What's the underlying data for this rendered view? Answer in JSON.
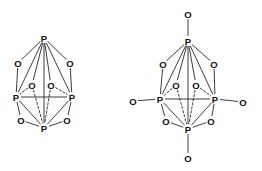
{
  "figure": {
    "background_color": "#ffffff",
    "bond_color": "#1a1a1a",
    "label_color": "#111111"
  },
  "structures": [
    {
      "id": "p4o6",
      "name": "P4O6",
      "atoms": [
        {
          "id": "p-top",
          "element": "P",
          "x": 44,
          "y": 38
        },
        {
          "id": "p-left",
          "element": "P",
          "x": 16,
          "y": 97
        },
        {
          "id": "p-right",
          "element": "P",
          "x": 72,
          "y": 97
        },
        {
          "id": "p-bottom",
          "element": "P",
          "x": 44,
          "y": 128
        },
        {
          "id": "o-upper-left",
          "element": "O",
          "x": 18,
          "y": 63
        },
        {
          "id": "o-upper-right",
          "element": "O",
          "x": 70,
          "y": 63
        },
        {
          "id": "o-mid-left",
          "element": "O",
          "x": 32,
          "y": 85
        },
        {
          "id": "o-mid-right",
          "element": "O",
          "x": 51,
          "y": 85
        },
        {
          "id": "o-lower-left",
          "element": "O",
          "x": 21,
          "y": 120
        },
        {
          "id": "o-lower-right",
          "element": "O",
          "x": 67,
          "y": 120
        }
      ],
      "bonds": [
        {
          "from": "p-top",
          "to": "o-upper-left",
          "style": "solid"
        },
        {
          "from": "p-top",
          "to": "o-upper-right",
          "style": "solid"
        },
        {
          "from": "p-top",
          "to": "o-mid-left",
          "style": "solid"
        },
        {
          "from": "p-top",
          "to": "o-mid-right",
          "style": "solid"
        },
        {
          "from": "p-top",
          "to": "p-left",
          "style": "solid"
        },
        {
          "from": "p-top",
          "to": "p-right",
          "style": "solid"
        },
        {
          "from": "p-top",
          "to": "p-bottom",
          "style": "solid"
        },
        {
          "from": "o-upper-left",
          "to": "p-left",
          "style": "solid"
        },
        {
          "from": "o-upper-right",
          "to": "p-right",
          "style": "solid"
        },
        {
          "from": "o-mid-left",
          "to": "p-left",
          "style": "dashed"
        },
        {
          "from": "o-mid-right",
          "to": "p-right",
          "style": "dashed"
        },
        {
          "from": "o-mid-left",
          "to": "p-bottom",
          "style": "dashed"
        },
        {
          "from": "o-mid-right",
          "to": "p-bottom",
          "style": "dashed"
        },
        {
          "from": "p-left",
          "to": "p-right",
          "style": "solid"
        },
        {
          "from": "p-left",
          "to": "p-bottom",
          "style": "solid"
        },
        {
          "from": "p-right",
          "to": "p-bottom",
          "style": "solid"
        },
        {
          "from": "p-left",
          "to": "o-lower-left",
          "style": "solid"
        },
        {
          "from": "p-right",
          "to": "o-lower-right",
          "style": "solid"
        },
        {
          "from": "o-lower-left",
          "to": "p-bottom",
          "style": "solid"
        },
        {
          "from": "o-lower-right",
          "to": "p-bottom",
          "style": "solid"
        }
      ]
    },
    {
      "id": "p4o10",
      "name": "P4O10",
      "atoms": [
        {
          "id": "p-top",
          "element": "P",
          "x": 188,
          "y": 41
        },
        {
          "id": "p-left",
          "element": "P",
          "x": 160,
          "y": 99
        },
        {
          "id": "p-right",
          "element": "P",
          "x": 215,
          "y": 99
        },
        {
          "id": "p-bottom",
          "element": "P",
          "x": 188,
          "y": 129
        },
        {
          "id": "o-upper-left",
          "element": "O",
          "x": 163,
          "y": 64
        },
        {
          "id": "o-upper-right",
          "element": "O",
          "x": 214,
          "y": 64
        },
        {
          "id": "o-mid-left",
          "element": "O",
          "x": 176,
          "y": 85
        },
        {
          "id": "o-mid-right",
          "element": "O",
          "x": 196,
          "y": 85
        },
        {
          "id": "o-lower-left",
          "element": "O",
          "x": 166,
          "y": 121
        },
        {
          "id": "o-lower-right",
          "element": "O",
          "x": 211,
          "y": 121
        },
        {
          "id": "o-term-top",
          "element": "O",
          "x": 188,
          "y": 14
        },
        {
          "id": "o-term-left",
          "element": "O",
          "x": 133,
          "y": 101
        },
        {
          "id": "o-term-right",
          "element": "O",
          "x": 243,
          "y": 102
        },
        {
          "id": "o-term-bottom",
          "element": "O",
          "x": 188,
          "y": 158
        }
      ],
      "bonds": [
        {
          "from": "o-term-top",
          "to": "p-top",
          "style": "solid"
        },
        {
          "from": "o-term-left",
          "to": "p-left",
          "style": "solid"
        },
        {
          "from": "o-term-right",
          "to": "p-right",
          "style": "solid"
        },
        {
          "from": "o-term-bottom",
          "to": "p-bottom",
          "style": "solid"
        },
        {
          "from": "p-top",
          "to": "o-upper-left",
          "style": "solid"
        },
        {
          "from": "p-top",
          "to": "o-upper-right",
          "style": "solid"
        },
        {
          "from": "p-top",
          "to": "o-mid-left",
          "style": "solid"
        },
        {
          "from": "p-top",
          "to": "o-mid-right",
          "style": "solid"
        },
        {
          "from": "p-top",
          "to": "p-left",
          "style": "solid"
        },
        {
          "from": "p-top",
          "to": "p-right",
          "style": "solid"
        },
        {
          "from": "p-top",
          "to": "p-bottom",
          "style": "solid"
        },
        {
          "from": "o-upper-left",
          "to": "p-left",
          "style": "solid"
        },
        {
          "from": "o-upper-right",
          "to": "p-right",
          "style": "solid"
        },
        {
          "from": "o-mid-left",
          "to": "p-left",
          "style": "dashed"
        },
        {
          "from": "o-mid-right",
          "to": "p-right",
          "style": "dashed"
        },
        {
          "from": "o-mid-left",
          "to": "p-bottom",
          "style": "dashed"
        },
        {
          "from": "o-mid-right",
          "to": "p-bottom",
          "style": "dashed"
        },
        {
          "from": "p-left",
          "to": "p-right",
          "style": "solid"
        },
        {
          "from": "p-left",
          "to": "p-bottom",
          "style": "solid"
        },
        {
          "from": "p-right",
          "to": "p-bottom",
          "style": "solid"
        },
        {
          "from": "p-left",
          "to": "o-lower-left",
          "style": "solid"
        },
        {
          "from": "p-right",
          "to": "o-lower-right",
          "style": "solid"
        },
        {
          "from": "o-lower-left",
          "to": "p-bottom",
          "style": "solid"
        },
        {
          "from": "o-lower-right",
          "to": "p-bottom",
          "style": "solid"
        }
      ]
    }
  ]
}
